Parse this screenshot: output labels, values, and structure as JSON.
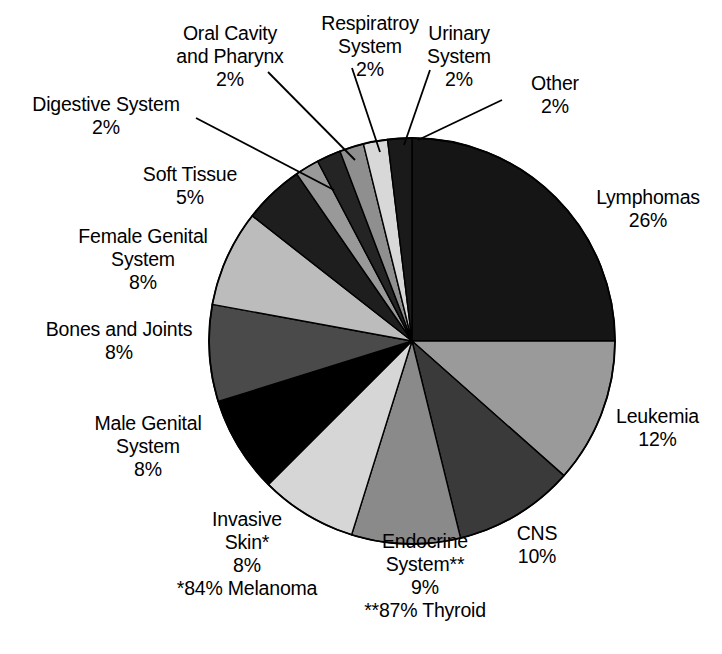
{
  "chart_data": {
    "type": "pie",
    "title": "",
    "subtitle": "",
    "xlabel": "",
    "ylabel": "",
    "legend_position": "none",
    "grid": false,
    "units": "percent",
    "start_angle_deg": 0,
    "direction": "clockwise",
    "categories": [
      "Lymphomas",
      "Leukemia",
      "CNS",
      "Endocrine System**",
      "Invasive Skin*",
      "Male Genital System",
      "Bones and Joints",
      "Female Genital System",
      "Soft Tissue",
      "Digestive System",
      "Oral Cavity and Pharynx",
      "Respiratroy System",
      "Urinary System",
      "Other"
    ],
    "values": [
      26,
      12,
      10,
      9,
      8,
      8,
      8,
      8,
      5,
      2,
      2,
      2,
      2,
      2
    ],
    "colors": [
      "#151515",
      "#9a9a9a",
      "#3a3a3a",
      "#8a8a8a",
      "#d6d6d6",
      "#000000",
      "#4a4a4a",
      "#bcbcbc",
      "#1e1e1e",
      "#999999",
      "#242424",
      "#8f8f8f",
      "#d8d8d8",
      "#1a1a1a"
    ],
    "footnotes": [
      "*84% Melanoma",
      "**87% Thyroid"
    ]
  },
  "labels": [
    {
      "name": "oral-cavity-and-pharynx",
      "lines": [
        "Oral Cavity",
        "and Pharynx",
        "2%"
      ],
      "x": 155,
      "y": 22,
      "width": 150,
      "align": "center"
    },
    {
      "name": "respiratroy-system",
      "lines": [
        "Respiratroy",
        "System",
        "2%"
      ],
      "x": 305,
      "y": 12,
      "width": 130,
      "align": "center"
    },
    {
      "name": "urinary-system",
      "lines": [
        "Urinary",
        "System",
        "2%"
      ],
      "x": 404,
      "y": 22,
      "width": 110,
      "align": "center"
    },
    {
      "name": "other",
      "lines": [
        "Other",
        "2%"
      ],
      "x": 505,
      "y": 72,
      "width": 100,
      "align": "center"
    },
    {
      "name": "digestive-system",
      "lines": [
        "Digestive System",
        "2%"
      ],
      "x": 16,
      "y": 93,
      "width": 180,
      "align": "center"
    },
    {
      "name": "soft-tissue",
      "lines": [
        "Soft Tissue",
        "5%"
      ],
      "x": 120,
      "y": 163,
      "width": 140,
      "align": "center"
    },
    {
      "name": "female-genital-system",
      "lines": [
        "Female Genital",
        "System",
        "8%"
      ],
      "x": 68,
      "y": 225,
      "width": 150,
      "align": "center"
    },
    {
      "name": "bones-and-joints",
      "lines": [
        "Bones and Joints",
        "8%"
      ],
      "x": 24,
      "y": 318,
      "width": 190,
      "align": "center"
    },
    {
      "name": "male-genital-system",
      "lines": [
        "Male Genital",
        "System",
        "8%"
      ],
      "x": 78,
      "y": 412,
      "width": 140,
      "align": "center"
    },
    {
      "name": "invasive-skin",
      "lines": [
        "Invasive",
        "Skin*",
        "8%",
        "*84% Melanoma"
      ],
      "x": 152,
      "y": 508,
      "width": 190,
      "align": "center"
    },
    {
      "name": "endocrine-system",
      "lines": [
        "Endocrine",
        "System**",
        "9%",
        "**87% Thyroid"
      ],
      "x": 330,
      "y": 530,
      "width": 190,
      "align": "center"
    },
    {
      "name": "cns",
      "lines": [
        "CNS",
        "10%"
      ],
      "x": 492,
      "y": 522,
      "width": 90,
      "align": "center"
    },
    {
      "name": "leukemia",
      "lines": [
        "Leukemia",
        "12%"
      ],
      "x": 600,
      "y": 405,
      "width": 115,
      "align": "center"
    },
    {
      "name": "lymphomas",
      "lines": [
        "Lymphomas",
        "26%"
      ],
      "x": 578,
      "y": 186,
      "width": 140,
      "align": "center"
    }
  ],
  "leader_lines": [
    {
      "name": "leader-digestive-system",
      "x1": 196,
      "y1": 118,
      "x2": 334,
      "y2": 190
    },
    {
      "name": "leader-oral-cavity",
      "x1": 268,
      "y1": 72,
      "x2": 355,
      "y2": 160
    },
    {
      "name": "leader-respiratroy-system",
      "x1": 352,
      "y1": 68,
      "x2": 380,
      "y2": 152
    },
    {
      "name": "leader-urinary-system",
      "x1": 430,
      "y1": 70,
      "x2": 404,
      "y2": 145
    },
    {
      "name": "leader-other",
      "x1": 502,
      "y1": 100,
      "x2": 418,
      "y2": 140
    }
  ],
  "pie_geometry": {
    "cx": 412,
    "cy": 341,
    "r": 203
  }
}
